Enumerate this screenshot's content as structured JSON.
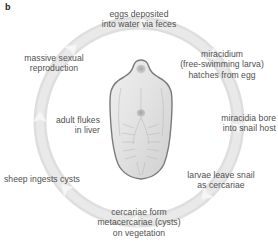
{
  "figure": {
    "panel_label": "b",
    "background_color": "#ffffff",
    "text_color": "#4f4f4f",
    "ring_color": "#dcdcdc",
    "arrow_color": "#f2f2f2",
    "ring_direction": "clockwise",
    "center_subject": "liver-fluke"
  },
  "stages": {
    "eggs": {
      "line1": "eggs deposited",
      "line2": "into water via feces",
      "position": "top"
    },
    "miracidium": {
      "line1": "miracidium",
      "line2": "(free-swimming larva)",
      "line3": "hatches from egg",
      "position": "upper-right"
    },
    "bore": {
      "line1": "miracidia bore",
      "line2": "into snail host",
      "position": "right"
    },
    "leave_snail": {
      "line1": "larvae leave snail",
      "line2": "as cercariae",
      "position": "lower-right"
    },
    "cercariae": {
      "line1": "cercariae form",
      "line2": "metacercariae (cysts)",
      "line3": "on vegetation",
      "position": "bottom"
    },
    "sheep": {
      "line1": "sheep ingests cysts",
      "position": "lower-left"
    },
    "adult": {
      "line1": "adult flukes",
      "line2": "in liver",
      "position": "left"
    },
    "massive": {
      "line1": "massive sexual",
      "line2": "reproduction",
      "position": "upper-left"
    }
  }
}
